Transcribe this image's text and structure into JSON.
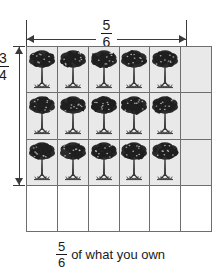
{
  "figure": {
    "caption_fraction": {
      "numerator": "5",
      "denominator": "6"
    },
    "caption_text": "of what you own",
    "top_measure": {
      "label_numerator": "5",
      "label_denominator": "6",
      "icon_left": "arrow-left-icon",
      "icon_right": "arrow-right-icon",
      "spans_columns": 5
    },
    "left_measure": {
      "label_numerator": "3",
      "label_denominator": "4",
      "icon_top": "arrow-up-icon",
      "icon_bottom": "arrow-down-icon",
      "spans_rows": 3
    },
    "grid": {
      "columns": 6,
      "rows": 4,
      "shaded_color": "#e9e9e9",
      "unshaded_color": "#ffffff",
      "line_color": "#6e6e6e",
      "tree_icon": "tree-icon",
      "cells": [
        [
          {
            "shaded": true,
            "tree": true
          },
          {
            "shaded": true,
            "tree": true
          },
          {
            "shaded": true,
            "tree": true
          },
          {
            "shaded": true,
            "tree": true
          },
          {
            "shaded": true,
            "tree": true
          },
          {
            "shaded": true,
            "tree": false
          }
        ],
        [
          {
            "shaded": true,
            "tree": true
          },
          {
            "shaded": true,
            "tree": true
          },
          {
            "shaded": true,
            "tree": true
          },
          {
            "shaded": true,
            "tree": true
          },
          {
            "shaded": true,
            "tree": true
          },
          {
            "shaded": true,
            "tree": false
          }
        ],
        [
          {
            "shaded": true,
            "tree": true
          },
          {
            "shaded": true,
            "tree": true
          },
          {
            "shaded": true,
            "tree": true
          },
          {
            "shaded": true,
            "tree": true
          },
          {
            "shaded": true,
            "tree": true
          },
          {
            "shaded": true,
            "tree": false
          }
        ],
        [
          {
            "shaded": false,
            "tree": false
          },
          {
            "shaded": false,
            "tree": false
          },
          {
            "shaded": false,
            "tree": false
          },
          {
            "shaded": false,
            "tree": false
          },
          {
            "shaded": false,
            "tree": false
          },
          {
            "shaded": false,
            "tree": false
          }
        ]
      ]
    }
  }
}
